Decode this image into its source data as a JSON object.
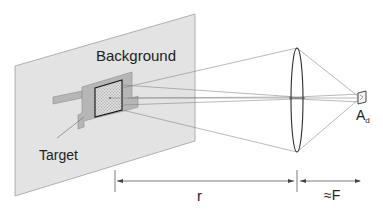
{
  "diagram": {
    "type": "optical-geometry",
    "labels": {
      "background": "Background",
      "target": "Target",
      "distance": "r",
      "focal": "≈F",
      "detector_main": "A",
      "detector_sub": "d"
    },
    "colors": {
      "plane_fill": "#e2e2e2",
      "plane_stroke": "#9a9a9a",
      "target_fill": "#b4b4b4",
      "target_stroke": "#8a8a8a",
      "hatch_fill": "#d6d6d6",
      "ray_stroke": "#7a7a7a",
      "lens_stroke": "#333333",
      "text": "#222222"
    }
  }
}
